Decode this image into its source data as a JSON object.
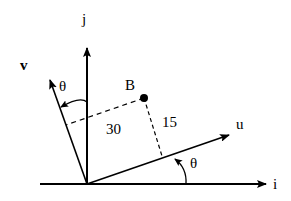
{
  "diagram": {
    "labels": {
      "i": "i",
      "j": "j",
      "u": "u",
      "v": "v",
      "point": "B",
      "theta_top": "θ",
      "theta_bottom": "θ",
      "dist_v": "30",
      "dist_u": "15"
    },
    "vectors": [
      {
        "name": "i",
        "label": "i",
        "description": "horizontal axis"
      },
      {
        "name": "j",
        "label": "j",
        "description": "vertical axis"
      },
      {
        "name": "u",
        "label": "u",
        "description": "rotated axis by theta from i"
      },
      {
        "name": "v",
        "label": "v",
        "description": "rotated axis by theta from j"
      }
    ],
    "point": {
      "label": "B",
      "u_distance": "30",
      "v_distance": "15"
    },
    "angle": "θ",
    "colors": {
      "stroke": "#000000",
      "background": "#ffffff"
    }
  }
}
